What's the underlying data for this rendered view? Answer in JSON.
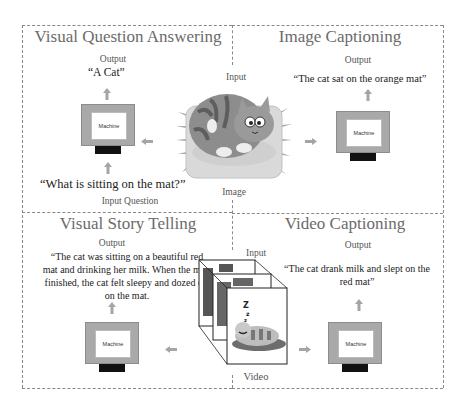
{
  "panels": {
    "vqa": {
      "title": "Visual Question Answering",
      "output_label": "Output",
      "output_text": "“A Cat”",
      "machine_label": "Machine",
      "question_text": "“What is sitting on the mat?”",
      "question_label": "Input Question"
    },
    "image_captioning": {
      "title": "Image Captioning",
      "output_label": "Output",
      "output_text": "“The cat sat on the orange mat”",
      "machine_label": "Machine"
    },
    "visual_story_telling": {
      "title": "Visual Story Telling",
      "output_label": "Output",
      "output_lines": [
        "“The cat was sitting on a beautiful red",
        "mat and drinking her milk. When the milk",
        "finished, the cat felt sleepy and dozed off",
        "on the mat."
      ],
      "machine_label": "Machine"
    },
    "video_captioning": {
      "title": "Video Captioning",
      "output_label": "Output",
      "output_lines": [
        "“The cat drank milk and slept on the",
        "red mat”"
      ],
      "machine_label": "Machine"
    }
  },
  "center_image": {
    "top_label": "Input",
    "bottom_label": "Image",
    "icon": "cat-on-mat-illustration"
  },
  "center_video": {
    "top_label": "Input",
    "bottom_label": "Video",
    "icon": "cat-video-frames-stack",
    "sleep_glyph": "Z z z"
  },
  "colors": {
    "machine_body": "#a9a9a9",
    "machine_stand": "#111111",
    "arrow": "#a5a5a5",
    "title": "#6b6b6b",
    "frame": "#888888",
    "cat_body": "#8d8d8d",
    "mat": "#d9d9d9"
  }
}
